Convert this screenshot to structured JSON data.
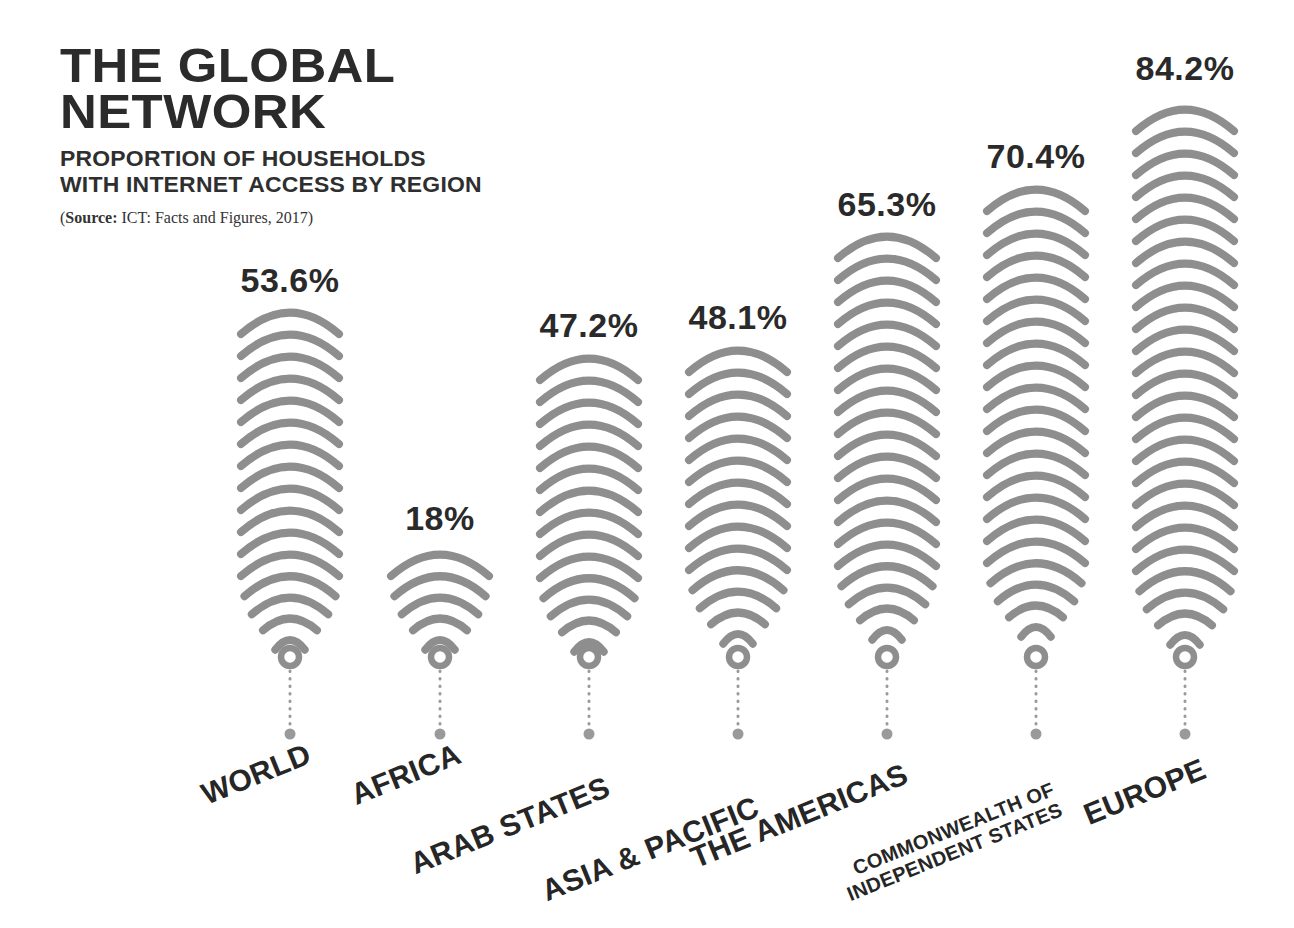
{
  "header": {
    "title_line1": "THE GLOBAL",
    "title_line2": "NETWORK",
    "subtitle_line1": "PROPORTION OF HOUSEHOLDS",
    "subtitle_line2": "WITH INTERNET ACCESS BY REGION",
    "source_prefix": "(",
    "source_label": "Source:",
    "source_text": " ICT: Facts and Figures, 2017)"
  },
  "colors": {
    "background": "#ffffff",
    "wave": "#8e8e8e",
    "text_dark": "#2a2a2a",
    "dot": "#9a9a9a"
  },
  "chart_data": {
    "type": "bar",
    "title": "THE GLOBAL NETWORK",
    "subtitle": "PROPORTION OF HOUSEHOLDS WITH INTERNET ACCESS BY REGION",
    "source": "ICT: Facts and Figures, 2017",
    "xlabel": "",
    "ylabel": "Proportion of households with internet access (%)",
    "ylim": [
      0,
      100
    ],
    "grid": false,
    "legend": "none",
    "unit": "%",
    "categories": [
      "WORLD",
      "AFRICA",
      "ARAB STATES",
      "ASIA & PACIFIC",
      "THE AMERICAS",
      "COMMONWEALTH OF INDEPENDENT STATES",
      "EUROPE"
    ],
    "values": [
      53.6,
      18,
      47.2,
      48.1,
      65.3,
      70.4,
      84.2
    ],
    "value_labels": [
      "53.6%",
      "18%",
      "47.2%",
      "48.1%",
      "65.3%",
      "70.4%",
      "84.2%"
    ]
  },
  "bars": [
    {
      "name": "world",
      "value_label": "53.6%",
      "value": 53.6,
      "label_line1": "WORLD",
      "label_line2": "",
      "cx": 290,
      "top": 308,
      "arcs": 16,
      "pct_y": 262,
      "label_size": 30,
      "label_x": 303,
      "label_y": 737
    },
    {
      "name": "africa",
      "value_label": "18%",
      "value": 18,
      "label_line1": "AFRICA",
      "label_line2": "",
      "cx": 440,
      "top": 550,
      "arcs": 5,
      "pct_y": 500,
      "label_size": 30,
      "label_x": 453,
      "label_y": 737
    },
    {
      "name": "arab-states",
      "value_label": "47.2%",
      "value": 47.2,
      "label_line1": "ARAB STATES",
      "label_line2": "",
      "cx": 589,
      "top": 354,
      "arcs": 14,
      "pct_y": 307,
      "label_size": 30,
      "label_x": 602,
      "label_y": 770
    },
    {
      "name": "asia-pacific",
      "value_label": "48.1%",
      "value": 48.1,
      "label_line1": "ASIA & PACIFIC",
      "label_line2": "",
      "cx": 738,
      "top": 346,
      "arcs": 14,
      "pct_y": 299,
      "label_size": 30,
      "label_x": 751,
      "label_y": 790
    },
    {
      "name": "the-americas",
      "value_label": "65.3%",
      "value": 65.3,
      "label_line1": "THE AMERICAS",
      "label_line2": "",
      "cx": 887,
      "top": 232,
      "arcs": 19,
      "pct_y": 186,
      "label_size": 30,
      "label_x": 900,
      "label_y": 757
    },
    {
      "name": "commonwealth-of-independent-states",
      "value_label": "70.4%",
      "value": 70.4,
      "label_line1": "COMMONWEALTH OF",
      "label_line2": "INDEPENDENT STATES",
      "cx": 1036,
      "top": 185,
      "arcs": 21,
      "pct_y": 138,
      "label_size": 20,
      "label_x": 1049,
      "label_y": 778
    },
    {
      "name": "europe",
      "value_label": "84.2%",
      "value": 84.2,
      "label_line1": "EUROPE",
      "label_line2": "",
      "cx": 1185,
      "top": 105,
      "arcs": 25,
      "pct_y": 50,
      "label_size": 30,
      "label_x": 1198,
      "label_y": 752
    }
  ],
  "geometry": {
    "arc_step": 22,
    "arc_stroke": 8,
    "arc_half_width": 49,
    "ring_y": 657,
    "dot_y": 734,
    "label_rotation_deg": -22
  }
}
